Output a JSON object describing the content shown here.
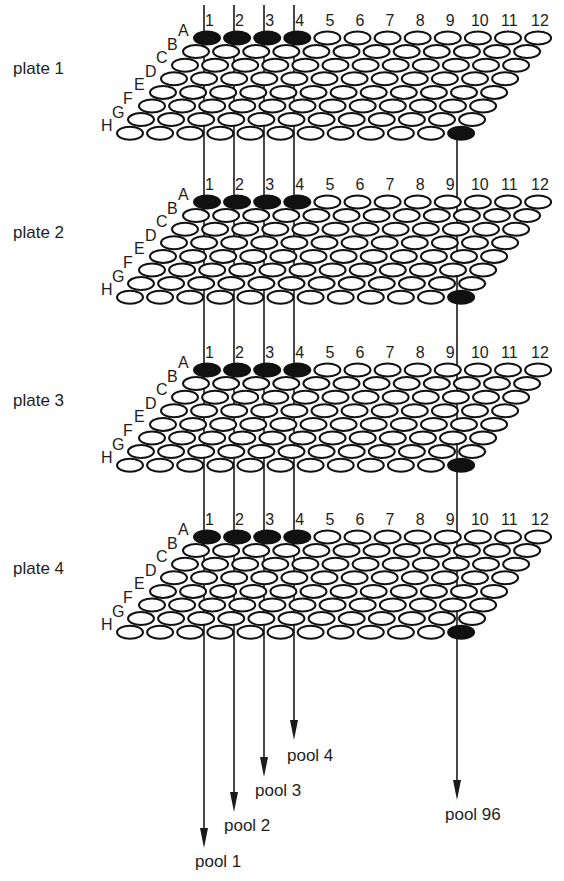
{
  "diagram": {
    "title": "",
    "columns": [
      "1",
      "2",
      "3",
      "4",
      "5",
      "6",
      "7",
      "8",
      "9",
      "10",
      "11",
      "12"
    ],
    "rows": [
      "A",
      "B",
      "C",
      "D",
      "E",
      "F",
      "G",
      "H"
    ],
    "plates": [
      {
        "label": "plate 1",
        "filled_wells": [
          "A1",
          "A2",
          "A3",
          "A4",
          "H12"
        ]
      },
      {
        "label": "plate 2",
        "filled_wells": [
          "A1",
          "A2",
          "A3",
          "A4",
          "H12"
        ]
      },
      {
        "label": "plate 3",
        "filled_wells": [
          "A1",
          "A2",
          "A3",
          "A4",
          "H12"
        ]
      },
      {
        "label": "plate 4",
        "filled_wells": [
          "A1",
          "A2",
          "A3",
          "A4",
          "H12"
        ]
      }
    ],
    "pools": [
      {
        "label": "pool 1",
        "column": "1"
      },
      {
        "label": "pool 2",
        "column": "2"
      },
      {
        "label": "pool 3",
        "column": "3"
      },
      {
        "label": "pool 4",
        "column": "4"
      },
      {
        "label": "pool 96",
        "column": "9"
      }
    ],
    "colors": {
      "ink": "#111111",
      "well_fill": "#ffffff",
      "background": "#ffffff"
    }
  },
  "layout": {
    "plate_top_y": [
      38,
      202,
      370,
      537
    ],
    "plate_label_y": [
      68,
      232,
      400,
      568
    ],
    "colA_x": 207,
    "col_spacing": 30.1,
    "row_dx": -11,
    "row_dy": 13.6,
    "well_rx": 13,
    "well_ry": 6.5,
    "pool_lines": [
      {
        "x": 204,
        "y1": 5,
        "tip_y": 848,
        "label_x": 195,
        "label_y": 867
      },
      {
        "x": 234,
        "y1": 5,
        "tip_y": 812,
        "label_x": 224,
        "label_y": 831
      },
      {
        "x": 264,
        "y1": 5,
        "tip_y": 777,
        "label_x": 255,
        "label_y": 796
      },
      {
        "x": 294,
        "y1": 5,
        "tip_y": 740,
        "label_x": 287,
        "label_y": 761
      },
      {
        "x": 457,
        "y1": 135,
        "tip_y": 800,
        "label_x": 445,
        "label_y": 820
      }
    ]
  }
}
